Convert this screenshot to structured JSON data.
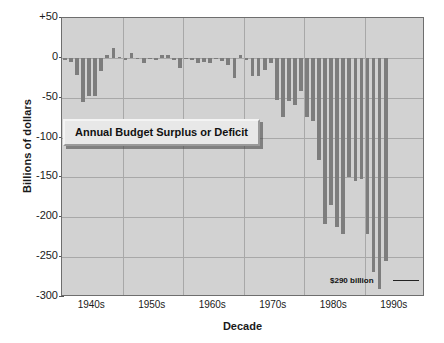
{
  "chart_data": {
    "type": "bar",
    "title": "Annual Budget Surplus or Deficit",
    "xlabel": "Decade",
    "ylabel": "Billions of dollars",
    "ylim": [
      -300,
      50
    ],
    "yticks": [
      50,
      0,
      -50,
      -100,
      -150,
      -200,
      -250,
      -300
    ],
    "ytick_labels": [
      "+50",
      "0",
      "-50",
      "-100",
      "-150",
      "-200",
      "-250",
      "-300"
    ],
    "xtick_labels": [
      "1940s",
      "1950s",
      "1960s",
      "1970s",
      "1980s",
      "1990s"
    ],
    "grid": true,
    "legend": "none",
    "bar_color": "#7d7d7d",
    "plot_background": "#d2d2d2",
    "annotations": [
      {
        "text": "$290 billion",
        "points_to_year": 1992,
        "value": -290
      }
    ],
    "x": [
      1940,
      1941,
      1942,
      1943,
      1944,
      1945,
      1946,
      1947,
      1948,
      1949,
      1950,
      1951,
      1952,
      1953,
      1954,
      1955,
      1956,
      1957,
      1958,
      1959,
      1960,
      1961,
      1962,
      1963,
      1964,
      1965,
      1966,
      1967,
      1968,
      1969,
      1970,
      1971,
      1972,
      1973,
      1974,
      1975,
      1976,
      1977,
      1978,
      1979,
      1980,
      1981,
      1982,
      1983,
      1984,
      1985,
      1986,
      1987,
      1988,
      1989,
      1990,
      1991,
      1992,
      1993
    ],
    "values": [
      -3,
      -5,
      -21,
      -55,
      -48,
      -48,
      -16,
      4,
      12,
      1,
      -3,
      6,
      -2,
      -7,
      -1,
      -3,
      4,
      3,
      -3,
      -13,
      0,
      -3,
      -7,
      -5,
      -6,
      -1,
      -4,
      -9,
      -25,
      3,
      -3,
      -23,
      -23,
      -15,
      -6,
      -53,
      -74,
      -54,
      -59,
      -41,
      -74,
      -79,
      -128,
      -208,
      -185,
      -212,
      -221,
      -150,
      -155,
      -152,
      -221,
      -269,
      -290,
      -255
    ],
    "series_name": "Annual budget surplus or deficit"
  },
  "axis": {
    "y_title": "Billions of dollars",
    "x_title": "Decade"
  },
  "callout": {
    "label": "Annual Budget Surplus or Deficit"
  },
  "annotation": {
    "label": "$290 billion"
  }
}
